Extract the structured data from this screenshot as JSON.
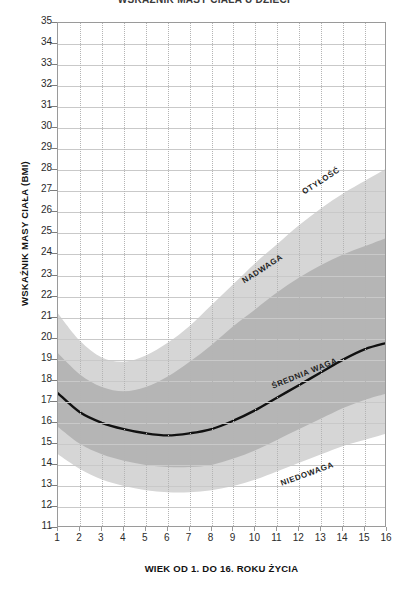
{
  "title": "WSKAŹNIK MASY CIAŁA U DZIECI",
  "axes": {
    "y_title": "WSKAŹNIK MASY CIAŁA (BMI)",
    "x_title": "WIEK OD 1. DO 16. ROKU ŻYCIA"
  },
  "colors": {
    "outer_band": "#d6d6d6",
    "inner_band": "#b5b5b5",
    "median_line": "#111111",
    "grid_solid": "#c9c9c9",
    "grid_dotted": "#b4b4b4",
    "frame": "#9a9a9a",
    "text": "#1a1a1a"
  },
  "regions": [
    {
      "key": "obesity",
      "label": "OTYŁOŚĆ",
      "x": 303,
      "y": 188,
      "angle": -33
    },
    {
      "key": "overweight",
      "label": "NADWAGA",
      "x": 243,
      "y": 277,
      "angle": -33
    },
    {
      "key": "average",
      "label": "ŚREDNIA WAGA",
      "x": 272,
      "y": 382,
      "angle": -22
    },
    {
      "key": "underweight",
      "label": "NIEDOWAGA",
      "x": 281,
      "y": 479,
      "angle": -20
    }
  ],
  "chart_data": {
    "type": "area",
    "title": "WSKAŹNIK MASY CIAŁA U DZIECI",
    "xlabel": "WIEK OD 1. DO 16. ROKU ŻYCIA",
    "ylabel": "WSKAŹNIK MASY CIAŁA (BMI)",
    "xlim": [
      1,
      16
    ],
    "ylim": [
      11,
      35
    ],
    "grid": true,
    "legend": "none",
    "x_ticks": [
      1,
      2,
      3,
      4,
      5,
      6,
      7,
      8,
      9,
      10,
      11,
      12,
      13,
      14,
      15,
      16
    ],
    "y_ticks": [
      11,
      12,
      13,
      14,
      15,
      16,
      17,
      18,
      19,
      20,
      21,
      22,
      23,
      24,
      25,
      26,
      27,
      28,
      29,
      30,
      31,
      32,
      33,
      34,
      35
    ],
    "x": [
      1,
      2,
      3,
      4,
      5,
      6,
      7,
      8,
      9,
      10,
      11,
      12,
      13,
      14,
      15,
      16
    ],
    "series": [
      {
        "name": "Górna granica otyłości",
        "role": "outer-upper",
        "values": [
          21.2,
          19.9,
          19.1,
          18.9,
          19.2,
          19.8,
          20.6,
          21.6,
          22.6,
          23.6,
          24.5,
          25.4,
          26.2,
          26.9,
          27.5,
          28.1
        ]
      },
      {
        "name": "Granica nadwagi",
        "role": "inner-upper",
        "values": [
          19.3,
          18.3,
          17.7,
          17.5,
          17.7,
          18.2,
          18.9,
          19.7,
          20.6,
          21.4,
          22.2,
          22.9,
          23.5,
          24.0,
          24.4,
          24.8
        ]
      },
      {
        "name": "Mediana (średnia waga)",
        "role": "median",
        "values": [
          17.4,
          16.5,
          16.0,
          15.7,
          15.5,
          15.4,
          15.5,
          15.7,
          16.1,
          16.6,
          17.2,
          17.8,
          18.4,
          19.0,
          19.5,
          19.8
        ]
      },
      {
        "name": "Granica niedowagi",
        "role": "inner-lower",
        "values": [
          15.8,
          15.0,
          14.5,
          14.2,
          14.0,
          13.9,
          13.9,
          14.0,
          14.3,
          14.7,
          15.2,
          15.7,
          16.2,
          16.7,
          17.1,
          17.4
        ]
      },
      {
        "name": "Dolna granica",
        "role": "outer-lower",
        "values": [
          14.5,
          13.8,
          13.3,
          13.0,
          12.8,
          12.7,
          12.7,
          12.8,
          13.0,
          13.3,
          13.7,
          14.1,
          14.5,
          14.9,
          15.2,
          15.5
        ]
      }
    ]
  }
}
